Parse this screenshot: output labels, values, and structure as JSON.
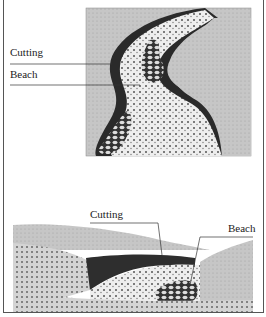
{
  "top_diagram": {
    "description": "Plan view of a meandering river showing cutting on outer bank and beach on inner bank",
    "labels": {
      "cutting": "Cutting",
      "beach": "Beach"
    }
  },
  "bottom_diagram": {
    "description": "Cross-section of a river meander showing cutting and beach",
    "labels": {
      "cutting": "Cutting",
      "beach": "Beach"
    }
  },
  "colors": {
    "land": "#c8c8c8",
    "bank": "#2a2a2a",
    "gravel": "#e8e8e8",
    "line": "#333333"
  }
}
